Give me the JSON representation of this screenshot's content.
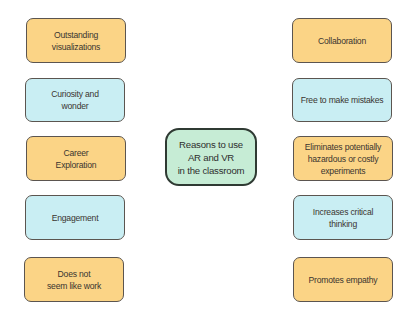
{
  "diagram": {
    "center": {
      "label": "Reasons to use\nAR and VR\nin the classroom",
      "color": "#c6ecd5"
    },
    "left": [
      {
        "label": "Outstanding\nvisualizations",
        "color": "#fbd486"
      },
      {
        "label": "Curiosity and\nwonder",
        "color": "#c9eef3"
      },
      {
        "label": "Career\nExploration",
        "color": "#fbd486"
      },
      {
        "label": "Engagement",
        "color": "#c9eef3"
      },
      {
        "label": "Does not\nseem like work",
        "color": "#fbd486"
      }
    ],
    "right": [
      {
        "label": "Collaboration",
        "color": "#fbd486"
      },
      {
        "label": "Free to make mistakes",
        "color": "#c9eef3"
      },
      {
        "label": "Eliminates potentially\nhazardous or costly\nexperiments",
        "color": "#fbd486"
      },
      {
        "label": "Increases critical\nthinking",
        "color": "#c9eef3"
      },
      {
        "label": "Promotes empathy",
        "color": "#fbd486"
      }
    ]
  }
}
